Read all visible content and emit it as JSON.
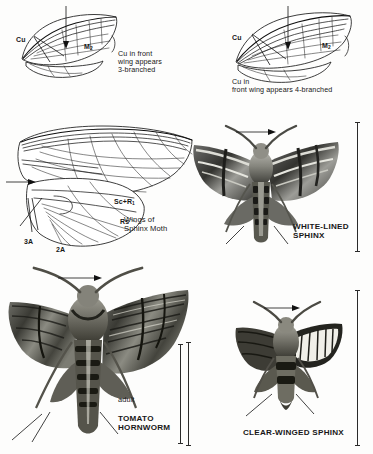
{
  "plate": {
    "title": "Sphinx moth wing venation and adult moths",
    "background": "#fdfdfc",
    "ink": "#1a1a1a"
  },
  "figures": [
    {
      "id": "fig-cu-3branched",
      "type": "wing-venation-diagram",
      "position": "top-left",
      "vein_labels": [
        {
          "name": "Cu",
          "text": "Cu"
        },
        {
          "name": "M2",
          "text": "M",
          "sub": "2"
        }
      ],
      "caption": "Cu in front\nwing appears\n3-branched",
      "pointer": "vertical-arrow-down"
    },
    {
      "id": "fig-cu-4branched",
      "type": "wing-venation-diagram",
      "position": "top-right",
      "vein_labels": [
        {
          "name": "Cu",
          "text": "Cu"
        },
        {
          "name": "M2",
          "text": "M",
          "sub": "2"
        }
      ],
      "caption": "Cu in\nfront wing appears 4-branched",
      "pointer": "vertical-arrow-down"
    },
    {
      "id": "fig-sphinx-wings",
      "type": "wing-venation-diagram",
      "position": "middle-left",
      "vein_labels": [
        {
          "name": "ScR1",
          "text": "Sc+R",
          "sub": "1"
        },
        {
          "name": "Rs",
          "text": "Rs"
        },
        {
          "name": "A3",
          "text": "3A"
        },
        {
          "name": "A2",
          "text": "2A"
        }
      ],
      "caption": "Wings of\nSphinx Moth",
      "pointer": "horizontal-arrow-right"
    }
  ],
  "specimens": [
    {
      "id": "white-lined-sphinx",
      "label": "WHITE-LINED\nSPHINX",
      "position": "middle-right",
      "has_scale_bar": true,
      "has_arrow": true
    },
    {
      "id": "tomato-hornworm",
      "label": "TOMATO\nHORNWORM",
      "stage_label": "adult",
      "position": "bottom-left",
      "has_scale_bar": true,
      "has_arrow": true
    },
    {
      "id": "clear-winged-sphinx",
      "label": "CLEAR-WINGED SPHINX",
      "position": "bottom-right",
      "has_scale_bar": true,
      "has_arrow": true
    }
  ],
  "colors": {
    "ink": "#1a1a1a",
    "page": "#fdfdfc",
    "photo_dark": "#2b2b2b",
    "photo_mid": "#8a8a88",
    "photo_light": "#d8d8d4"
  }
}
